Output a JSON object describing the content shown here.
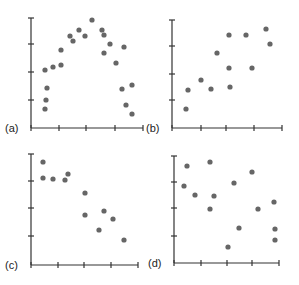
{
  "chart_data": [
    {
      "type": "scatter",
      "label": "(a)",
      "description": "inverted-U / curvilinear relationship",
      "x": [
        45,
        46,
        47,
        45,
        53,
        61,
        61,
        70,
        73,
        79,
        85,
        92,
        102,
        104,
        104,
        110,
        116,
        124,
        122,
        132,
        126,
        132
      ],
      "y": [
        109,
        100,
        88,
        70,
        67,
        65,
        50,
        36,
        41,
        30,
        36,
        20,
        30,
        35,
        53,
        44,
        63,
        47,
        89,
        85,
        105,
        114
      ],
      "panel": {
        "ox": 31,
        "oy": 128,
        "top": 18,
        "xticks": [
          31,
          59,
          86,
          115,
          143
        ],
        "yticks": [
          18,
          44,
          72,
          100
        ]
      }
    },
    {
      "type": "scatter",
      "label": "(b)",
      "description": "positive linear relationship",
      "x": [
        186,
        188,
        201,
        211,
        217,
        229,
        229,
        230,
        246,
        252,
        266,
        270
      ],
      "y": [
        109,
        90,
        80,
        89,
        53,
        35,
        68,
        87,
        35,
        68,
        29,
        44
      ],
      "panel": {
        "ox": 172,
        "oy": 128,
        "top": 20,
        "xticks": [
          172,
          201,
          226,
          254,
          282
        ],
        "yticks": [
          20,
          46,
          74,
          100
        ]
      }
    },
    {
      "type": "scatter",
      "label": "(c)",
      "description": "negative linear relationship",
      "x": [
        43,
        43,
        53,
        65,
        68,
        85,
        85,
        104,
        99,
        113,
        124
      ],
      "y": [
        162,
        178,
        179,
        180,
        174,
        193,
        215,
        211,
        230,
        219,
        240
      ],
      "panel": {
        "ox": 31,
        "oy": 265,
        "top": 154,
        "xticks": [
          31,
          58,
          84,
          111,
          138
        ],
        "yticks": [
          154,
          181,
          208,
          236
        ]
      }
    },
    {
      "type": "scatter",
      "label": "(d)",
      "description": "no relationship",
      "x": [
        187,
        210,
        184,
        195,
        214,
        210,
        234,
        252,
        239,
        258,
        275,
        274,
        228,
        275
      ],
      "y": [
        166,
        162,
        186,
        195,
        196,
        209,
        183,
        172,
        228,
        209,
        229,
        202,
        247,
        240
      ],
      "panel": {
        "ox": 174,
        "oy": 263,
        "top": 156,
        "xticks": [
          174,
          201,
          227,
          252,
          279
        ],
        "yticks": [
          156,
          182,
          208,
          236
        ]
      }
    }
  ]
}
